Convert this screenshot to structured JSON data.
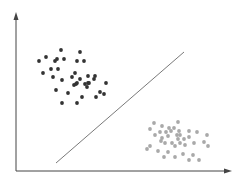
{
  "colors": {
    "axis": "#444444",
    "boundary": "#6a6a6a",
    "class_a": "#333333",
    "class_b": "#a9a9a9"
  },
  "chart_data": {
    "type": "scatter",
    "title": "",
    "xlabel": "",
    "ylabel": "",
    "grid": false,
    "legend": null,
    "axes": {
      "origin": [
        16,
        171
      ],
      "x_end": [
        232,
        171
      ],
      "y_end": [
        16,
        12
      ]
    },
    "decision_boundary": {
      "x1": 56,
      "y1": 163,
      "x2": 184,
      "y2": 52
    },
    "series": [
      {
        "name": "class_a",
        "color": "#333333",
        "points": [
          [
            39,
            61
          ],
          [
            46,
            57
          ],
          [
            61,
            50
          ],
          [
            80,
            52
          ],
          [
            55,
            61
          ],
          [
            57,
            59
          ],
          [
            64,
            59
          ],
          [
            77,
            61
          ],
          [
            84,
            61
          ],
          [
            43,
            73
          ],
          [
            51,
            69
          ],
          [
            58,
            69
          ],
          [
            53,
            77
          ],
          [
            62,
            80
          ],
          [
            72,
            77
          ],
          [
            75,
            73
          ],
          [
            80,
            79
          ],
          [
            88,
            76
          ],
          [
            95,
            76
          ],
          [
            94,
            79
          ],
          [
            88,
            83
          ],
          [
            85,
            84
          ],
          [
            76,
            84
          ],
          [
            74,
            85
          ],
          [
            77,
            83
          ],
          [
            106,
            83
          ],
          [
            87,
            87
          ],
          [
            89,
            83
          ],
          [
            56,
            90
          ],
          [
            68,
            93
          ],
          [
            82,
            97
          ],
          [
            96,
            97
          ],
          [
            100,
            92
          ],
          [
            104,
            94
          ],
          [
            62,
            103
          ],
          [
            77,
            103
          ]
        ]
      },
      {
        "name": "class_b",
        "color": "#a9a9a9",
        "points": [
          [
            154,
            123
          ],
          [
            178,
            122
          ],
          [
            150,
            129
          ],
          [
            162,
            126
          ],
          [
            169,
            128
          ],
          [
            174,
            128
          ],
          [
            155,
            135
          ],
          [
            160,
            132
          ],
          [
            166,
            132
          ],
          [
            171,
            131
          ],
          [
            179,
            131
          ],
          [
            189,
            131
          ],
          [
            197,
            132
          ],
          [
            207,
            135
          ],
          [
            162,
            138
          ],
          [
            168,
            136
          ],
          [
            177,
            135
          ],
          [
            180,
            135
          ],
          [
            184,
            139
          ],
          [
            189,
            137
          ],
          [
            161,
            141
          ],
          [
            165,
            143
          ],
          [
            172,
            143
          ],
          [
            175,
            146
          ],
          [
            180,
            143
          ],
          [
            185,
            145
          ],
          [
            194,
            143
          ],
          [
            204,
            142
          ],
          [
            208,
            146
          ],
          [
            150,
            146
          ],
          [
            147,
            149
          ],
          [
            158,
            151
          ],
          [
            168,
            152
          ],
          [
            183,
            154
          ],
          [
            193,
            155
          ],
          [
            164,
            157
          ],
          [
            175,
            157
          ],
          [
            189,
            160
          ],
          [
            199,
            160
          ],
          [
            178,
            139
          ]
        ]
      }
    ]
  }
}
